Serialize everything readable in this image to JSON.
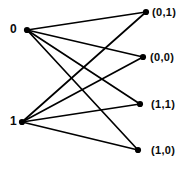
{
  "diagram": {
    "type": "bipartite-graph",
    "title": "",
    "width": 191,
    "height": 169,
    "background_color": "#ffffff",
    "edge_color": "#000000",
    "node_color": "#000000",
    "label_color": "#0a0a0a",
    "edge_width": 1.7,
    "node_radius": 3.1,
    "left_nodes": [
      {
        "id": "n0",
        "label": "0",
        "x": 27,
        "y": 30,
        "label_x": 10,
        "label_y": 23
      },
      {
        "id": "n1",
        "label": "1",
        "x": 22,
        "y": 122,
        "label_x": 10,
        "label_y": 115
      }
    ],
    "right_nodes": [
      {
        "id": "r01",
        "label": "(0,1)",
        "x": 146,
        "y": 12,
        "label_x": 152,
        "label_y": 6
      },
      {
        "id": "r00",
        "label": "(0,0)",
        "x": 143,
        "y": 57,
        "label_x": 150,
        "label_y": 51
      },
      {
        "id": "r11",
        "label": "(1,1)",
        "x": 140,
        "y": 104,
        "label_x": 151,
        "label_y": 98
      },
      {
        "id": "r10",
        "label": "(1,0)",
        "x": 138,
        "y": 150,
        "label_x": 151,
        "label_y": 144
      }
    ],
    "edges": [
      {
        "id": "e-n0-r01",
        "from": "n0",
        "to": "r01",
        "x1": 27,
        "y1": 30,
        "x2": 146,
        "y2": 12
      },
      {
        "id": "e-n0-r00",
        "from": "n0",
        "to": "r00",
        "x1": 27,
        "y1": 30,
        "x2": 143,
        "y2": 57
      },
      {
        "id": "e-n0-r11",
        "from": "n0",
        "to": "r11",
        "x1": 27,
        "y1": 30,
        "x2": 140,
        "y2": 104
      },
      {
        "id": "e-n0-r10",
        "from": "n0",
        "to": "r10",
        "x1": 27,
        "y1": 30,
        "x2": 138,
        "y2": 150
      },
      {
        "id": "e-n1-r01",
        "from": "n1",
        "to": "r01",
        "x1": 22,
        "y1": 122,
        "x2": 146,
        "y2": 12
      },
      {
        "id": "e-n1-r00",
        "from": "n1",
        "to": "r00",
        "x1": 22,
        "y1": 122,
        "x2": 143,
        "y2": 57
      },
      {
        "id": "e-n1-r11",
        "from": "n1",
        "to": "r11",
        "x1": 22,
        "y1": 122,
        "x2": 140,
        "y2": 104
      },
      {
        "id": "e-n1-r10",
        "from": "n1",
        "to": "r10",
        "x1": 22,
        "y1": 122,
        "x2": 138,
        "y2": 150
      }
    ]
  }
}
